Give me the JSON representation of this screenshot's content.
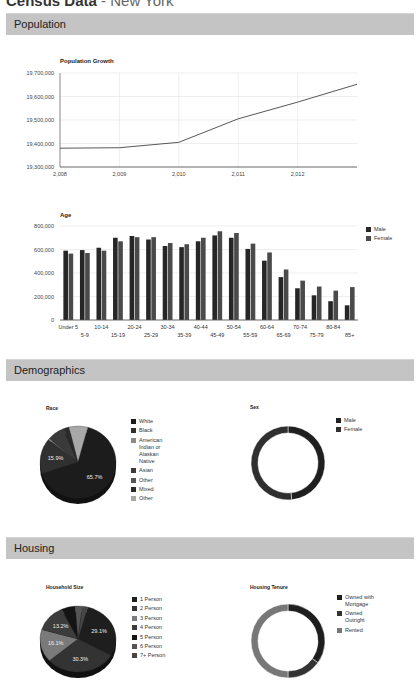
{
  "header": {
    "title": "Census Data",
    "subtitle": "- New York"
  },
  "sections": {
    "population": {
      "label": "Population"
    },
    "demographics": {
      "label": "Demographics"
    },
    "housing": {
      "label": "Housing"
    }
  },
  "colors": {
    "section_bar": "#c4c4c4",
    "line": "#444444",
    "male": "#262626",
    "female": "#4a4a4a"
  },
  "chart_data": [
    {
      "id": "population_growth",
      "type": "line",
      "title": "Population Growth",
      "xlabel": "",
      "ylabel": "",
      "x": [
        2008,
        2009,
        2010,
        2011,
        2012,
        2013
      ],
      "x_tick_labels": [
        "2,008",
        "2,009",
        "2,010",
        "2,011",
        "2,012"
      ],
      "y_tick_labels": [
        "19,700,000",
        "19,600,000",
        "19,500,000",
        "19,400,000",
        "19,300,000"
      ],
      "values": [
        19380000,
        19382000,
        19405000,
        19505000,
        19576000,
        19652000
      ],
      "ylim": [
        19300000,
        19700000
      ],
      "grid": true
    },
    {
      "id": "age",
      "type": "bar",
      "title": "Age",
      "categories": [
        "Under 5",
        "5-9",
        "10-14",
        "15-19",
        "20-24",
        "25-29",
        "30-34",
        "35-39",
        "40-44",
        "45-49",
        "50-54",
        "55-59",
        "60-64",
        "65-69",
        "70-74",
        "75-79",
        "80-84",
        "85+"
      ],
      "series": [
        {
          "name": "Male",
          "values": [
            590000,
            595000,
            615000,
            700000,
            715000,
            685000,
            630000,
            620000,
            670000,
            720000,
            700000,
            605000,
            505000,
            365000,
            270000,
            210000,
            160000,
            125000
          ]
        },
        {
          "name": "Female",
          "values": [
            565000,
            570000,
            590000,
            670000,
            705000,
            705000,
            655000,
            645000,
            700000,
            755000,
            740000,
            650000,
            575000,
            430000,
            335000,
            285000,
            250000,
            280000
          ]
        }
      ],
      "y_tick_labels": [
        "800,000",
        "600,000",
        "400,000",
        "200,000",
        "0"
      ],
      "ylim": [
        0,
        800000
      ],
      "grid": true,
      "legend_position": "right"
    },
    {
      "id": "race",
      "type": "pie",
      "title": "Race",
      "labels": [
        "White",
        "Black",
        "American Indian or Alaskan Native",
        "Asian",
        "Other",
        "Mixed",
        "Other"
      ],
      "values": [
        65.7,
        15.9,
        0.6,
        7.3,
        0.1,
        2.4,
        8.0
      ],
      "slice_labels": [
        "65.7%",
        "15.9%",
        "",
        "",
        "",
        "",
        ""
      ],
      "colors": [
        "#1c1c1c",
        "#303030",
        "#8a8a8a",
        "#3a3a3a",
        "#555555",
        "#2a2a2a",
        "#a8a8a8"
      ],
      "legend_position": "right"
    },
    {
      "id": "sex",
      "type": "pie",
      "title": "Sex",
      "donut": true,
      "labels": [
        "Male",
        "Female"
      ],
      "values": [
        48.4,
        51.6
      ],
      "colors": [
        "#1f1f1f",
        "#2f2f2f"
      ],
      "legend_position": "right"
    },
    {
      "id": "household_size",
      "type": "pie",
      "title": "Household Size",
      "labels": [
        "1 Person",
        "2 Person",
        "3 Person",
        "4 Person",
        "5 Person",
        "6 Person",
        "7+ Person"
      ],
      "values": [
        29.1,
        30.3,
        16.1,
        13.2,
        6.0,
        3.0,
        2.3
      ],
      "slice_labels": [
        "29.1%",
        "30.3%",
        "16.1%",
        "13.2%",
        "",
        "",
        ""
      ],
      "colors": [
        "#1e1e1e",
        "#333333",
        "#7a7a7a",
        "#3c3c3c",
        "#141414",
        "#555555",
        "#464646"
      ],
      "legend_position": "right"
    },
    {
      "id": "housing_tenure",
      "type": "pie",
      "title": "Housing Tenure",
      "donut": true,
      "labels": [
        "Owned with Mortgage",
        "Owned Outright",
        "Rented"
      ],
      "values": [
        35.0,
        15.0,
        50.0
      ],
      "colors": [
        "#1e1e1e",
        "#333333",
        "#777777"
      ],
      "legend_position": "right"
    }
  ]
}
